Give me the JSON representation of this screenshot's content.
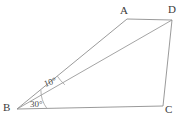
{
  "figure": {
    "background_color": "#ffffff",
    "line_color": "#8a8a8a",
    "label_color": "#3b3b3b",
    "width": 193,
    "height": 122,
    "vertices": [
      {
        "id": "A",
        "label": "A",
        "x": 127,
        "y": 19,
        "label_x": 120,
        "label_y": 5
      },
      {
        "id": "B",
        "label": "B",
        "x": 17,
        "y": 109,
        "label_x": 3,
        "label_y": 102
      },
      {
        "id": "C",
        "label": "C",
        "x": 163,
        "y": 106,
        "label_x": 165,
        "label_y": 104
      },
      {
        "id": "D",
        "label": "D",
        "x": 172,
        "y": 20,
        "label_x": 168,
        "label_y": 4
      }
    ],
    "segments": [
      {
        "id": "AD",
        "from": "A",
        "to": "D",
        "role": "side-top"
      },
      {
        "id": "BA",
        "from": "B",
        "to": "A",
        "role": "side-upper-left"
      },
      {
        "id": "BD",
        "from": "B",
        "to": "D",
        "role": "diagonal"
      },
      {
        "id": "BC",
        "from": "B",
        "to": "C",
        "role": "side-bottom"
      },
      {
        "id": "DC",
        "from": "D",
        "to": "C",
        "role": "side-right"
      }
    ],
    "angles": [
      {
        "id": "angle-ABD",
        "value": "10",
        "degree_symbol": "°",
        "text": "10°",
        "at_vertex": "B",
        "between": [
          "BA",
          "BD"
        ],
        "label_x": 46,
        "label_y": 80
      },
      {
        "id": "angle-ABC-lower",
        "value": "30",
        "degree_symbol": "°",
        "text": "30°",
        "at_vertex": "B",
        "between": [
          "BA",
          "BC"
        ],
        "label_x": 30,
        "label_y": 100
      }
    ]
  }
}
